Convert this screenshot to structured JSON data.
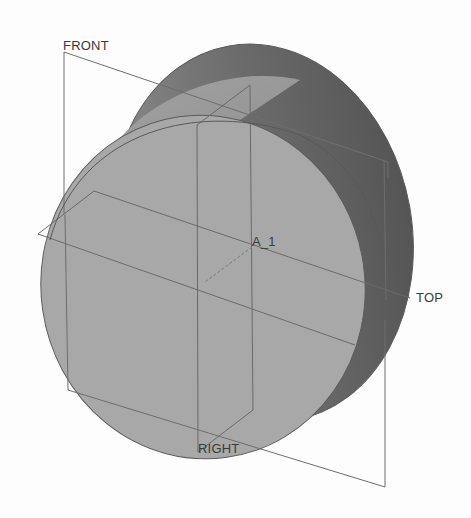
{
  "viewport": {
    "background": "#fdfdfd",
    "model": {
      "type": "cylinder",
      "face_color": "#a9a9a9",
      "side_color_light": "#8a8a8a",
      "side_color_dark": "#5e5e5e",
      "edge_color": "#555555"
    },
    "datum_line_color": "#6e6e6e",
    "labels": {
      "front": "FRONT",
      "top": "TOP",
      "right": "RIGHT",
      "axis": "A_1"
    }
  }
}
